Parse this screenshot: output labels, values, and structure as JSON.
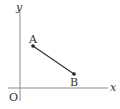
{
  "diagram": {
    "type": "coordinate-plane",
    "axes": {
      "x_label": "x",
      "y_label": "y",
      "origin_label": "O"
    },
    "points": [
      {
        "label": "A",
        "px": 33,
        "py": 46
      },
      {
        "label": "B",
        "px": 74,
        "py": 74
      }
    ],
    "segments": [
      {
        "from": "A",
        "to": "B"
      }
    ],
    "colors": {
      "axis": "#888888",
      "segment": "#333333",
      "text": "#333333"
    }
  }
}
